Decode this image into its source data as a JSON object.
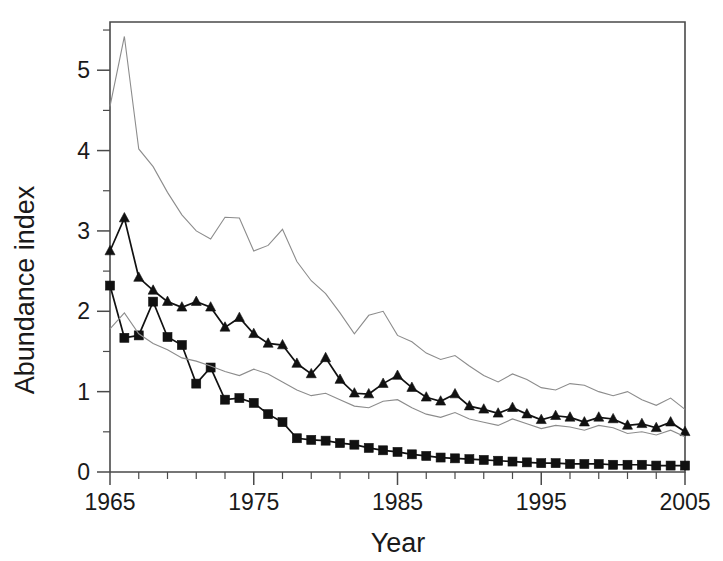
{
  "chart_data": {
    "type": "line",
    "title": "",
    "subtitle": "",
    "xlabel": "Year",
    "ylabel": "Abundance index",
    "xlim": [
      1965,
      2005
    ],
    "ylim": [
      0,
      5.6
    ],
    "grid": false,
    "legend_position": "none",
    "x_ticks_major": [
      1965,
      1975,
      1985,
      1995,
      2005
    ],
    "x_tick_labels": [
      "1965",
      "1975",
      "1985",
      "1995",
      "2005"
    ],
    "x_minor_step": 2,
    "y_ticks_major": [
      0,
      1,
      2,
      3,
      4,
      5
    ],
    "y_tick_labels": [
      "0",
      "1",
      "2",
      "3",
      "4",
      "5"
    ],
    "y_minor_step": 0.5,
    "x": [
      1965,
      1966,
      1967,
      1968,
      1969,
      1970,
      1971,
      1972,
      1973,
      1974,
      1975,
      1976,
      1977,
      1978,
      1979,
      1980,
      1981,
      1982,
      1983,
      1984,
      1985,
      1986,
      1987,
      1988,
      1989,
      1990,
      1991,
      1992,
      1993,
      1994,
      1995,
      1996,
      1997,
      1998,
      1999,
      2000,
      2001,
      2002,
      2003,
      2004,
      2005
    ],
    "series": [
      {
        "name": "upper-confidence-limit",
        "style": "thin-line",
        "marker": "none",
        "color": "#8c8c8c",
        "values": [
          4.55,
          5.42,
          4.02,
          3.8,
          3.48,
          3.2,
          3.0,
          2.9,
          3.17,
          3.16,
          2.75,
          2.82,
          3.02,
          2.62,
          2.38,
          2.22,
          1.98,
          1.72,
          1.95,
          2.0,
          1.7,
          1.62,
          1.48,
          1.4,
          1.45,
          1.32,
          1.2,
          1.12,
          1.22,
          1.15,
          1.05,
          1.02,
          1.1,
          1.08,
          1.0,
          0.95,
          1.0,
          0.9,
          0.83,
          0.92,
          0.78
        ]
      },
      {
        "name": "abundance-index-triangles",
        "style": "line-with-markers",
        "marker": "triangle",
        "color": "#111111",
        "values": [
          2.75,
          3.16,
          2.42,
          2.26,
          2.12,
          2.05,
          2.12,
          2.05,
          1.8,
          1.92,
          1.72,
          1.6,
          1.58,
          1.35,
          1.22,
          1.42,
          1.15,
          0.98,
          0.97,
          1.1,
          1.2,
          1.05,
          0.93,
          0.88,
          0.97,
          0.82,
          0.78,
          0.73,
          0.8,
          0.72,
          0.65,
          0.7,
          0.68,
          0.62,
          0.68,
          0.66,
          0.58,
          0.6,
          0.55,
          0.62,
          0.5
        ]
      },
      {
        "name": "abundance-index-squares",
        "style": "line-with-markers",
        "marker": "square",
        "color": "#111111",
        "values": [
          2.32,
          1.67,
          1.7,
          2.12,
          1.68,
          1.58,
          1.1,
          1.3,
          0.9,
          0.92,
          0.86,
          0.72,
          0.62,
          0.42,
          0.4,
          0.39,
          0.36,
          0.34,
          0.3,
          0.27,
          0.25,
          0.22,
          0.2,
          0.18,
          0.17,
          0.16,
          0.15,
          0.14,
          0.13,
          0.12,
          0.11,
          0.11,
          0.1,
          0.1,
          0.1,
          0.09,
          0.09,
          0.09,
          0.08,
          0.08,
          0.08
        ]
      },
      {
        "name": "lower-confidence-limit",
        "style": "thin-line",
        "marker": "none",
        "color": "#8c8c8c",
        "values": [
          1.78,
          1.98,
          1.72,
          1.6,
          1.52,
          1.42,
          1.38,
          1.32,
          1.25,
          1.2,
          1.28,
          1.22,
          1.12,
          1.02,
          0.95,
          0.98,
          0.9,
          0.82,
          0.8,
          0.88,
          0.9,
          0.8,
          0.72,
          0.68,
          0.74,
          0.66,
          0.62,
          0.58,
          0.66,
          0.6,
          0.54,
          0.58,
          0.56,
          0.52,
          0.58,
          0.55,
          0.48,
          0.5,
          0.46,
          0.52,
          0.44
        ]
      }
    ]
  },
  "axes": {
    "y_title": "Abundance index",
    "x_title": "Year"
  }
}
